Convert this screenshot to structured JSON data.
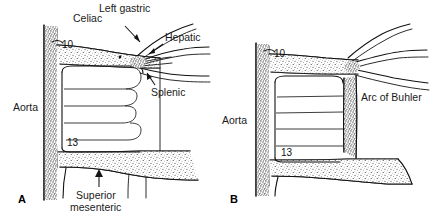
{
  "figure": {
    "kind": "anatomical-line-drawing",
    "background_color": "#ffffff",
    "ink_color": "#111111",
    "panels": [
      {
        "id": "A",
        "letter": "A",
        "labels": {
          "aorta": "Aorta",
          "celiac": "Celiac",
          "left_gastric": "Left gastric",
          "hepatic": "Hepatic",
          "splenic": "Splenic",
          "superior_mesenteric_line1": "Superior",
          "superior_mesenteric_line2": "mesenteric"
        },
        "numeric_markers": {
          "upper": "10",
          "lower": "13"
        }
      },
      {
        "id": "B",
        "letter": "B",
        "labels": {
          "aorta": "Aorta",
          "arc_of_buhler": "Arc of Buhler"
        },
        "numeric_markers": {
          "upper": "10",
          "lower": "13"
        }
      }
    ]
  }
}
